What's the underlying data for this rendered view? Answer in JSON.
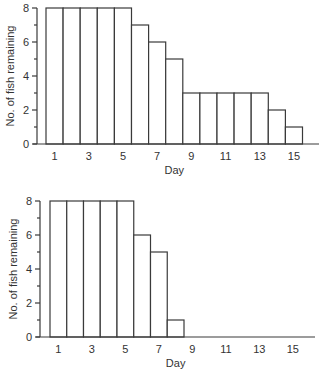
{
  "chart_data": [
    {
      "type": "bar",
      "title": "",
      "xlabel": "Day",
      "ylabel": "No. of fish remaining",
      "categories": [
        1,
        2,
        3,
        4,
        5,
        6,
        7,
        8,
        9,
        10,
        11,
        12,
        13,
        14,
        15
      ],
      "values": [
        8,
        8,
        8,
        8,
        8,
        7,
        6,
        5,
        3,
        3,
        3,
        3,
        3,
        2,
        1
      ],
      "xticks": [
        1,
        3,
        5,
        7,
        9,
        11,
        13,
        15
      ],
      "yticks": [
        0,
        2,
        4,
        6,
        8
      ],
      "ylim": [
        0,
        8
      ],
      "grid": false,
      "legend": null
    },
    {
      "type": "bar",
      "title": "",
      "xlabel": "Day",
      "ylabel": "No. of fish remaining",
      "categories": [
        1,
        2,
        3,
        4,
        5,
        6,
        7,
        8,
        9,
        10,
        11,
        12,
        13,
        14,
        15
      ],
      "values": [
        8,
        8,
        8,
        8,
        8,
        6,
        5,
        1,
        0,
        0,
        0,
        0,
        0,
        0,
        0
      ],
      "xticks": [
        1,
        3,
        5,
        7,
        9,
        11,
        13,
        15
      ],
      "yticks": [
        0,
        2,
        4,
        6,
        8
      ],
      "ylim": [
        0,
        8
      ],
      "grid": false,
      "legend": null
    }
  ]
}
